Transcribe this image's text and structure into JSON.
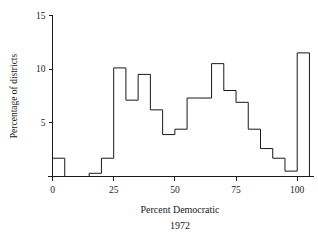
{
  "chart_data": {
    "type": "bar",
    "title": "",
    "subtitle": "",
    "xlabel": "Percent Democratic",
    "xlabel_line2": "1972",
    "ylabel": "Percentage of districts",
    "xlim": [
      -2,
      107
    ],
    "ylim": [
      0,
      15
    ],
    "grid": false,
    "legend": null,
    "bin_width": 5,
    "bin_edges": [
      0,
      5,
      10,
      15,
      20,
      25,
      30,
      35,
      40,
      45,
      50,
      55,
      60,
      65,
      70,
      75,
      80,
      85,
      90,
      95,
      100,
      105
    ],
    "categories": [
      "0-5",
      "5-10",
      "10-15",
      "15-20",
      "20-25",
      "25-30",
      "30-35",
      "35-40",
      "40-45",
      "45-50",
      "50-55",
      "55-60",
      "60-65",
      "65-70",
      "70-75",
      "75-80",
      "80-85",
      "85-90",
      "90-95",
      "95-100",
      "100-105"
    ],
    "values": [
      1.7,
      0,
      0,
      0.3,
      1.7,
      10.1,
      7.1,
      9.5,
      6.2,
      3.9,
      4.4,
      7.3,
      7.3,
      10.5,
      8.0,
      6.9,
      4.4,
      2.6,
      1.7,
      0.5,
      11.5
    ],
    "x_ticks": [
      0,
      25,
      50,
      75,
      100
    ],
    "x_tick_labels": [
      "0",
      "25",
      "50",
      "75",
      "100"
    ],
    "y_ticks": [
      5,
      10,
      15
    ],
    "y_tick_labels": [
      "5",
      "10",
      "15"
    ],
    "colors": {
      "line": "#1a1a1a",
      "fill": "none",
      "background": "#ffffff"
    }
  }
}
